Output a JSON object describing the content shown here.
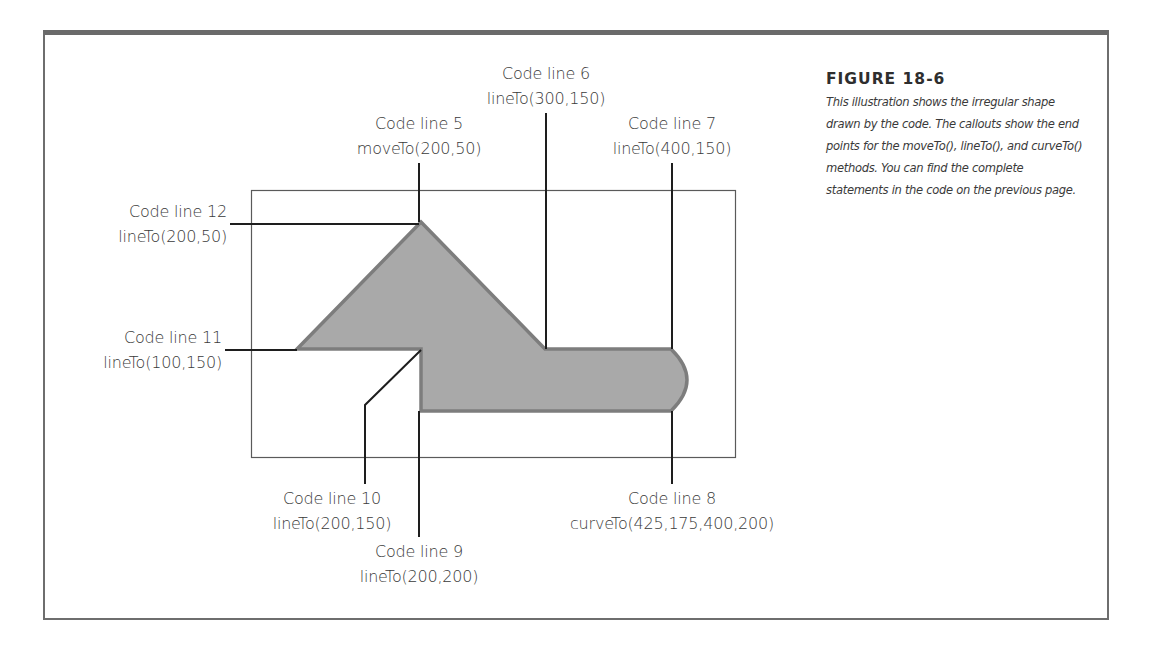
{
  "figure": {
    "title": "FIGURE 18-6",
    "caption": "This illustration shows the irregular shape drawn by the code. The callouts show the end points for the moveTo(), lineTo(), and curveTo() methods. You can find the complete statements in the code on the previous page."
  },
  "callouts": [
    {
      "id": "line5",
      "line": "Code line 5",
      "call": "moveTo(200,50)"
    },
    {
      "id": "line6",
      "line": "Code line 6",
      "call": "lineTo(300,150)"
    },
    {
      "id": "line7",
      "line": "Code line 7",
      "call": "lineTo(400,150)"
    },
    {
      "id": "line8",
      "line": "Code line 8",
      "call": "curveTo(425,175,400,200)"
    },
    {
      "id": "line9",
      "line": "Code line 9",
      "call": "lineTo(200,200)"
    },
    {
      "id": "line10",
      "line": "Code line 10",
      "call": "lineTo(200,150)"
    },
    {
      "id": "line11",
      "line": "Code line 11",
      "call": "lineTo(100,150)"
    },
    {
      "id": "line12",
      "line": "Code line 12",
      "call": "lineTo(200,50)"
    }
  ],
  "shape": {
    "fill": "#a9a9a9",
    "stroke": "#7d7d7d",
    "points": [
      [
        200,
        50
      ],
      [
        300,
        150
      ],
      [
        400,
        150
      ],
      [
        425,
        175
      ],
      [
        400,
        200
      ],
      [
        200,
        200
      ],
      [
        200,
        150
      ],
      [
        100,
        150
      ],
      [
        200,
        50
      ]
    ]
  },
  "colors": {
    "frame": "#6a6a6a",
    "callout_line": "#1e1e1e",
    "canvas_border": "#5a5a5a",
    "text": "#3a3a3a"
  }
}
